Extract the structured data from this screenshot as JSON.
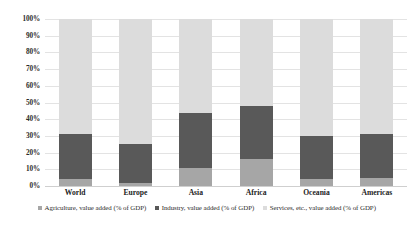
{
  "chart_data": {
    "type": "bar",
    "stacked": true,
    "stack_mode": "percent",
    "title": "",
    "subtitle": "",
    "xlabel": "",
    "ylabel": "",
    "ylim": [
      0,
      100
    ],
    "yticks": [
      "0%",
      "10%",
      "20%",
      "30%",
      "40%",
      "50%",
      "60%",
      "70%",
      "80%",
      "90%",
      "100%"
    ],
    "ytick_values": [
      0,
      10,
      20,
      30,
      40,
      50,
      60,
      70,
      80,
      90,
      100
    ],
    "grid": true,
    "legend_position": "bottom",
    "categories": [
      "World",
      "Europe",
      "Asia",
      "Africa",
      "Oceania",
      "Americas"
    ],
    "series": [
      {
        "name": "Agriculture, value added (% of GDP)",
        "color": "#a6a6a6",
        "values": [
          4,
          2,
          11,
          16,
          4,
          5
        ]
      },
      {
        "name": "Industry, value added (% of GDP)",
        "color": "#595959",
        "values": [
          27,
          23,
          33,
          32,
          26,
          26
        ]
      },
      {
        "name": "Services, etc., value added (% of GDP)",
        "color": "#dcdcdc",
        "values": [
          69,
          75,
          56,
          52,
          70,
          69
        ]
      }
    ],
    "cumulative_tops": {
      "agriculture": [
        4,
        2,
        11,
        16,
        4,
        5
      ],
      "industry": [
        31,
        25,
        44,
        48,
        30,
        31
      ],
      "services": [
        100,
        100,
        100,
        100,
        100,
        100
      ]
    }
  },
  "legend": {
    "items": [
      {
        "label": "Agriculture, value added (% of GDP)",
        "color": "#a6a6a6",
        "marker": "square-swatch"
      },
      {
        "label": "Industry, value added (% of GDP)",
        "color": "#595959",
        "marker": "square-swatch"
      },
      {
        "label": "Services, etc., value added (% of GDP)",
        "color": "#dcdcdc",
        "marker": "square-swatch"
      }
    ]
  },
  "colors": {
    "agriculture": "#a6a6a6",
    "industry": "#595959",
    "services": "#dcdcdc",
    "gridline": "#e3e3e3",
    "background": "#ffffff",
    "text": "#2b2b2b"
  }
}
